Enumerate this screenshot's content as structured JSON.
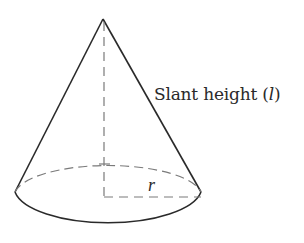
{
  "diagram": {
    "type": "cone",
    "labels": {
      "slant_prefix": "Slant height (",
      "slant_var": "l",
      "slant_suffix": ")",
      "radius": "r"
    },
    "colors": {
      "stroke": "#2a2a2a",
      "dashed": "#7a7a7a",
      "background": "#ffffff"
    },
    "geometry": {
      "apex": [
        103,
        19
      ],
      "base_center": [
        108,
        196
      ],
      "base_rx": 94,
      "base_ry": 32
    }
  }
}
